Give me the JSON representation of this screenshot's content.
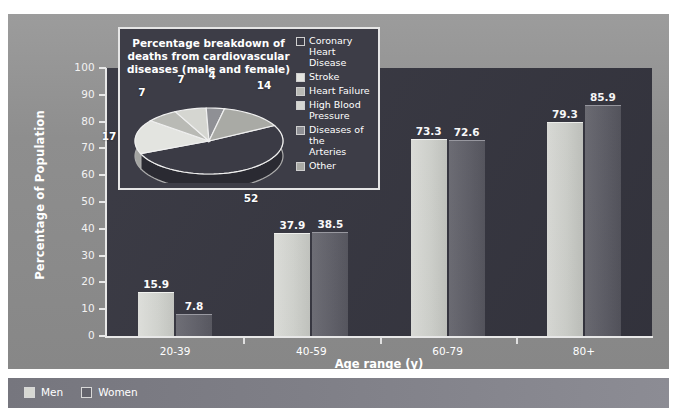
{
  "chart_data": {
    "type": "bar",
    "title": "",
    "xlabel": "Age range (y)",
    "ylabel": "Percentage of Population",
    "ylim": [
      0,
      100
    ],
    "ytick_labels": [
      "0",
      "10",
      "20",
      "30",
      "40",
      "50",
      "60",
      "70",
      "80",
      "90",
      "100"
    ],
    "ytick_values": [
      0,
      10,
      20,
      30,
      40,
      50,
      60,
      70,
      80,
      90,
      100
    ],
    "grid": false,
    "legend_position": "bottom-left",
    "categories": [
      "20-39",
      "40-59",
      "60-79",
      "80+"
    ],
    "series": [
      {
        "name": "Men",
        "color": "#d7d8d3",
        "values": [
          15.9,
          37.9,
          73.3,
          79.3
        ]
      },
      {
        "name": "Women",
        "color": "#63636c",
        "values": [
          7.8,
          38.5,
          72.6,
          85.9
        ]
      }
    ]
  },
  "inset_pie": {
    "type": "pie",
    "title": "Percentage breakdown of deaths from cardiovascular diseases (male and female)",
    "title_lines": [
      "Percentage breakdown of",
      "deaths from cardiovascular",
      "diseases (male and female)"
    ],
    "labels": [
      "Coronary Heart Disease",
      "Stroke",
      "Heart Failure",
      "High Blood Pressure",
      "Diseases of the Arteries",
      "Other"
    ],
    "legend_lines": [
      [
        "Coronary Heart",
        "Disease"
      ],
      [
        "Stroke"
      ],
      [
        "Heart Failure"
      ],
      [
        "High Blood",
        "Pressure"
      ],
      [
        "Diseases of the",
        "Arteries"
      ],
      [
        "Other"
      ]
    ],
    "values": [
      52,
      17,
      7,
      7,
      4,
      14
    ],
    "value_labels": [
      "52",
      "17",
      "7",
      "7",
      "4",
      "14"
    ],
    "colors": [
      "#3b3b45",
      "#e3e4e0",
      "#b9bab5",
      "#d5d6d1",
      "#8f9095",
      "#a9aaa5"
    ]
  },
  "bottom_legend": {
    "items": [
      {
        "label": "Men",
        "color": "#d7d8d3"
      },
      {
        "label": "Women",
        "color": "#63636c"
      }
    ]
  },
  "palette": {
    "plot_background": "#35353f",
    "frame_background": "#8e8e8e",
    "axis_color": "#e8e8e8",
    "text_color": "#ffffff"
  }
}
